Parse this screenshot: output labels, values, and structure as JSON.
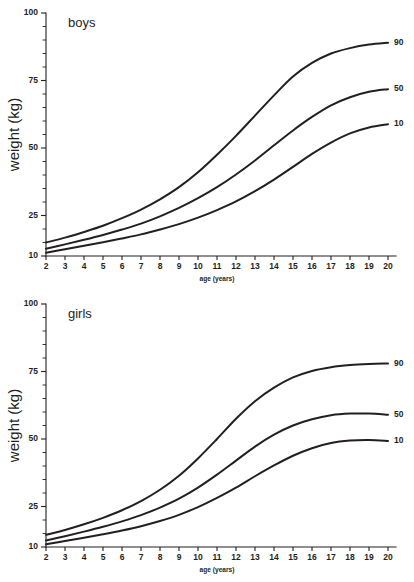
{
  "figure": {
    "background_color": "#ffffff",
    "line_color": "#231f20"
  },
  "charts": [
    {
      "id": "boys",
      "panel_title": "boys",
      "xlabel": "age (years)",
      "ylabel": "weight (kg)"
    },
    {
      "id": "girls",
      "panel_title": "girls",
      "xlabel": "age (years)",
      "ylabel": "weight (kg)"
    }
  ],
  "chart_data": [
    {
      "type": "line",
      "id": "boys",
      "title": "boys",
      "xlabel": "age (years)",
      "ylabel": "weight (kg)",
      "xlim": [
        2,
        20
      ],
      "ylim": [
        10,
        100
      ],
      "xticks": [
        2,
        3,
        4,
        5,
        6,
        7,
        8,
        9,
        10,
        11,
        12,
        13,
        14,
        15,
        16,
        17,
        18,
        19,
        20
      ],
      "xtick_labels": [
        "2",
        "3",
        "4",
        "5",
        "6",
        "7",
        "8",
        "9",
        "10",
        "11",
        "12",
        "13",
        "14",
        "15",
        "16",
        "17",
        "18",
        "19",
        "20"
      ],
      "yticks": [
        10,
        25,
        50,
        75,
        100
      ],
      "ytick_labels": [
        "10",
        "25",
        "50",
        "75",
        "100"
      ],
      "yminor_step": 5,
      "grid": false,
      "legend_position": "right-end-labels",
      "x": [
        2,
        3,
        4,
        5,
        6,
        7,
        8,
        9,
        10,
        11,
        12,
        13,
        14,
        15,
        16,
        17,
        18,
        19,
        20
      ],
      "series": [
        {
          "name": "90",
          "label": "90",
          "values": [
            15.0,
            16.8,
            18.9,
            21.2,
            24.0,
            27.2,
            31.0,
            35.5,
            41.0,
            47.5,
            54.5,
            62.0,
            69.5,
            76.5,
            81.5,
            85.0,
            87.0,
            88.3,
            89.0
          ]
        },
        {
          "name": "50",
          "label": "50",
          "values": [
            12.7,
            14.3,
            16.0,
            17.8,
            19.8,
            22.0,
            24.7,
            27.8,
            31.4,
            35.5,
            40.2,
            45.4,
            51.0,
            56.5,
            61.5,
            65.8,
            68.8,
            70.8,
            71.8
          ]
        },
        {
          "name": "10",
          "label": "10",
          "values": [
            11.2,
            12.5,
            13.8,
            15.1,
            16.5,
            18.0,
            19.8,
            21.8,
            24.2,
            27.0,
            30.2,
            34.0,
            38.3,
            43.0,
            47.8,
            52.0,
            55.4,
            57.6,
            58.8
          ]
        }
      ]
    },
    {
      "type": "line",
      "id": "girls",
      "title": "girls",
      "xlabel": "age (years)",
      "ylabel": "weight (kg)",
      "xlim": [
        2,
        20
      ],
      "ylim": [
        10,
        100
      ],
      "xticks": [
        2,
        3,
        4,
        5,
        6,
        7,
        8,
        9,
        10,
        11,
        12,
        13,
        14,
        15,
        16,
        17,
        18,
        19,
        20
      ],
      "xtick_labels": [
        "2",
        "3",
        "4",
        "5",
        "6",
        "7",
        "8",
        "9",
        "10",
        "11",
        "12",
        "13",
        "14",
        "15",
        "16",
        "17",
        "18",
        "19",
        "20"
      ],
      "yticks": [
        10,
        25,
        50,
        75,
        100
      ],
      "ytick_labels": [
        "10",
        "25",
        "50",
        "75",
        "100"
      ],
      "yminor_step": 5,
      "grid": false,
      "legend_position": "right-end-labels",
      "x": [
        2,
        3,
        4,
        5,
        6,
        7,
        8,
        9,
        10,
        11,
        12,
        13,
        14,
        15,
        16,
        17,
        18,
        19,
        20
      ],
      "series": [
        {
          "name": "90",
          "label": "90",
          "values": [
            14.5,
            16.3,
            18.4,
            20.8,
            23.6,
            27.0,
            31.2,
            36.4,
            42.8,
            50.0,
            57.5,
            64.0,
            69.0,
            72.8,
            75.2,
            76.6,
            77.4,
            77.8,
            78.0
          ]
        },
        {
          "name": "50",
          "label": "50",
          "values": [
            12.4,
            14.0,
            15.7,
            17.5,
            19.5,
            21.8,
            24.6,
            27.9,
            32.0,
            36.8,
            42.0,
            47.2,
            51.6,
            55.0,
            57.3,
            58.8,
            59.4,
            59.4,
            59.0
          ]
        },
        {
          "name": "10",
          "label": "10",
          "values": [
            11.0,
            12.2,
            13.4,
            14.7,
            16.1,
            17.7,
            19.6,
            21.9,
            24.8,
            28.2,
            32.0,
            36.2,
            40.2,
            43.8,
            46.6,
            48.5,
            49.4,
            49.6,
            49.3
          ]
        }
      ]
    }
  ]
}
